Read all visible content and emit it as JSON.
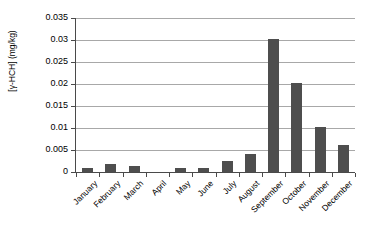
{
  "chart_data": {
    "type": "bar",
    "title": "",
    "xlabel": "",
    "ylabel": "[γ-HCH] (mg/kg)",
    "categories": [
      "January",
      "February",
      "March",
      "April",
      "May",
      "June",
      "July",
      "August",
      "September",
      "October",
      "November",
      "December"
    ],
    "values": [
      0.0009,
      0.0018,
      0.0013,
      0.0,
      0.001,
      0.0009,
      0.0026,
      0.0041,
      0.0302,
      0.0202,
      0.0102,
      0.0062
    ],
    "series": [
      {
        "name": "[γ-HCH] (mg/kg)",
        "values": [
          0.0009,
          0.0018,
          0.0013,
          0.0,
          0.001,
          0.0009,
          0.0026,
          0.0041,
          0.0302,
          0.0202,
          0.0102,
          0.0062
        ]
      }
    ],
    "ylim": [
      0,
      0.035
    ],
    "ytick_labels": [
      "0",
      "0.005",
      "0.01",
      "0.015",
      "0.02",
      "0.025",
      "0.03",
      "0.035"
    ],
    "ytick_values": [
      0,
      0.005,
      0.01,
      0.015,
      0.02,
      0.025,
      0.03,
      0.035
    ],
    "grid": true,
    "grid_axis": "y",
    "legend": false,
    "legend_position": "none",
    "bar_color": "#4e4e4e",
    "grid_color": "#a8a8a8",
    "axis_color": "#4a4a4a",
    "background_color": "#ffffff",
    "x_tick_label_rotation": -45
  }
}
